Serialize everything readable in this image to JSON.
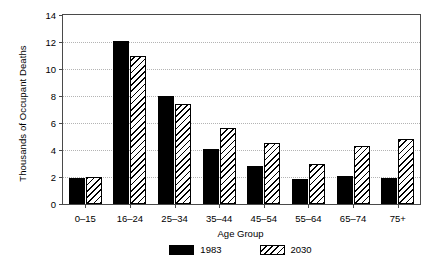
{
  "chart_data": {
    "type": "bar",
    "title": "",
    "xlabel": "Age Group",
    "ylabel": "Thousands of Occupant Deaths",
    "categories": [
      "0–15",
      "16–24",
      "25–34",
      "35–44",
      "45–54",
      "55–64",
      "65–74",
      "75+"
    ],
    "series": [
      {
        "name": "1983",
        "style": "solid-black",
        "color": "#000000",
        "values": [
          1.9,
          12.1,
          8.0,
          4.1,
          2.8,
          1.85,
          2.1,
          1.9
        ]
      },
      {
        "name": "2030",
        "style": "diagonal-hatch",
        "color": "#000000",
        "values": [
          2.0,
          11.0,
          7.4,
          5.6,
          4.5,
          3.0,
          4.3,
          4.8
        ]
      }
    ],
    "ylim": [
      0,
      14
    ],
    "yticks": [
      0,
      2,
      4,
      6,
      8,
      10,
      12,
      14
    ],
    "ytick_labels": [
      "0",
      "2",
      "4",
      "6",
      "8",
      "10",
      "12",
      "14"
    ],
    "grid": "horizontal-dotted",
    "legend_position": "bottom-center",
    "legend_entries": [
      "1983",
      "2030"
    ]
  }
}
